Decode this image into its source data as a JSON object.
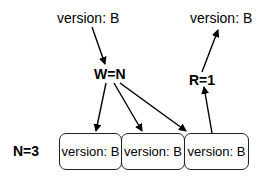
{
  "diagram": {
    "write_input": {
      "label": "version: B"
    },
    "write_quorum": {
      "label": "W=N"
    },
    "read_quorum": {
      "label": "R=1"
    },
    "read_output": {
      "label": "version: B"
    },
    "replica_count": {
      "label": "N=3"
    },
    "replicas": [
      {
        "label": "version: B"
      },
      {
        "label": "version: B"
      },
      {
        "label": "version: B"
      }
    ],
    "edges": [
      {
        "from": "write_input",
        "to": "write_quorum"
      },
      {
        "from": "write_quorum",
        "to": "replicas.0"
      },
      {
        "from": "write_quorum",
        "to": "replicas.1"
      },
      {
        "from": "write_quorum",
        "to": "replicas.2"
      },
      {
        "from": "replicas.2",
        "to": "read_quorum"
      },
      {
        "from": "read_quorum",
        "to": "read_output"
      }
    ]
  }
}
